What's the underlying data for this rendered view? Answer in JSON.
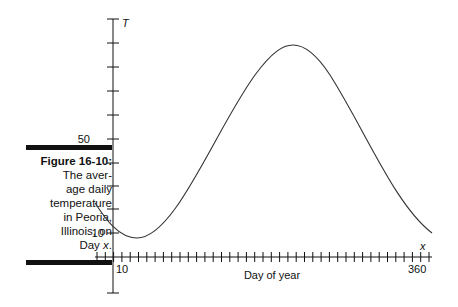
{
  "caption": {
    "title": "Figure 16-10:",
    "body_lines": [
      "The aver-",
      "age daily",
      "temperature",
      "in Peoria,",
      "Illinois, on"
    ],
    "last_line_prefix": "Day ",
    "last_line_var": "x",
    "last_line_suffix": "."
  },
  "chart_data": {
    "type": "line",
    "xlabel": "Day of year",
    "ylabel": "T",
    "x_var_label": "x",
    "x_tick_labels": [
      "10",
      "360"
    ],
    "y_tick_labels": [
      "10",
      "50"
    ],
    "xlim": [
      0,
      370
    ],
    "ylim": [
      -15,
      100
    ],
    "grid": false,
    "series": [
      {
        "name": "Average daily temperature",
        "x": [
          -20,
          0,
          10,
          25,
          50,
          100,
          150,
          180,
          200,
          250,
          300,
          340,
          365
        ],
        "values": [
          22,
          13,
          10,
          8,
          12,
          36,
          72,
          88,
          90,
          72,
          38,
          18,
          10
        ]
      }
    ]
  }
}
